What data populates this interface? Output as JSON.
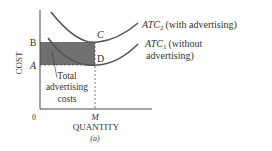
{
  "diagram": {
    "y_axis_label": "COST",
    "x_axis_label": "QUANTITY",
    "subfigure_label": "(a)",
    "origin_label": "0",
    "x_tick": "M",
    "y_ticks": {
      "upper": "B",
      "lower": "A"
    },
    "points": {
      "upper": "C",
      "lower": "D"
    },
    "shaded_region_label": [
      "Total",
      "advertising",
      "costs"
    ],
    "curves": [
      {
        "name": "ATC",
        "subscript": "2",
        "description": "(with advertising)"
      },
      {
        "name": "ATC",
        "subscript": "1",
        "description_line1": "(without",
        "description_line2": "advertising)"
      }
    ],
    "colors": {
      "curve": "#555555",
      "shade": "#6e6e6e",
      "axis": "#444444",
      "text": "#333333"
    }
  }
}
